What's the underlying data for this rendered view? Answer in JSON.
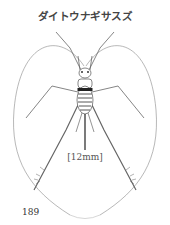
{
  "page": {
    "title": "ダイトウナギサスズ",
    "figure": {
      "subject": "cricket-illustration",
      "scale_caption": "[12mm]"
    },
    "page_number": "189"
  }
}
